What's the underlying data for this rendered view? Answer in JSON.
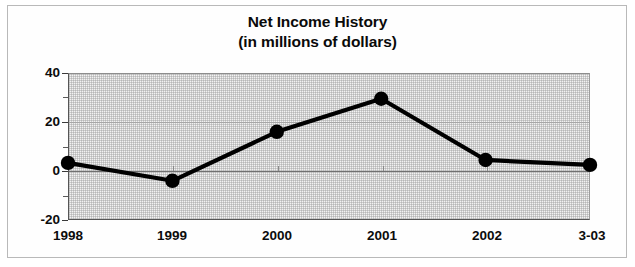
{
  "chart_data": {
    "type": "line",
    "title": "Net Income History",
    "subtitle": "(in millions of dollars)",
    "xlabel": "",
    "ylabel": "",
    "categories": [
      "1998",
      "1999",
      "2000",
      "2001",
      "2002",
      "3-03"
    ],
    "values": [
      3.3,
      -4.0,
      16.0,
      29.5,
      4.5,
      2.5
    ],
    "series": [
      {
        "name": "Net Income",
        "values": [
          3.3,
          -4.0,
          16.0,
          29.5,
          4.5,
          2.5
        ]
      }
    ],
    "ylim": [
      -20,
      40
    ],
    "ytick_labels": [
      "40",
      "20",
      "0",
      "-20"
    ],
    "ytick_values": [
      40,
      20,
      0,
      -20
    ],
    "yminor_values": [
      30,
      10,
      -10
    ],
    "xtick_labels": [
      "1998",
      "1999",
      "2000",
      "2001",
      "2002",
      "3-03"
    ],
    "grid": true,
    "legend": "none",
    "marker": "filled-circle",
    "line_color": "#000000",
    "marker_color": "#000000",
    "plot_background": "#f2f2f2",
    "frame_color": "#b9b9b9"
  },
  "title_lines": {
    "line1": "Net Income History",
    "line2": "(in millions of dollars)"
  }
}
